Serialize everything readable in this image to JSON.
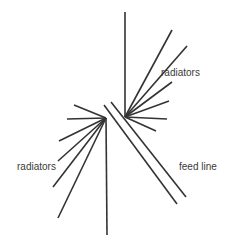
{
  "diagram": {
    "type": "antenna-schematic",
    "labels": {
      "upper_radiators": "radiators",
      "lower_radiators": "radiators",
      "feed_line": "feed line"
    },
    "colors": {
      "line": "#333333",
      "text": "#3a3a3a",
      "background": "#ffffff"
    },
    "upper_hub": {
      "center": [
        125,
        117
      ],
      "radiator_endpoints": [
        [
          125,
          12
        ],
        [
          172,
          30
        ],
        [
          187,
          46
        ],
        [
          172,
          82
        ],
        [
          169,
          101
        ],
        [
          167,
          119
        ],
        [
          156,
          131
        ]
      ]
    },
    "lower_hub": {
      "center": [
        106,
        118
      ],
      "radiator_endpoints": [
        [
          74,
          105
        ],
        [
          67,
          119
        ],
        [
          59,
          141
        ],
        [
          58,
          161
        ],
        [
          53,
          187
        ],
        [
          58,
          218
        ],
        [
          107,
          235
        ]
      ]
    },
    "feed_line": {
      "conductors": [
        [
          [
            104,
            105
          ],
          [
            177,
            204
          ]
        ],
        [
          [
            111,
            102
          ],
          [
            186,
            197
          ]
        ]
      ]
    }
  }
}
